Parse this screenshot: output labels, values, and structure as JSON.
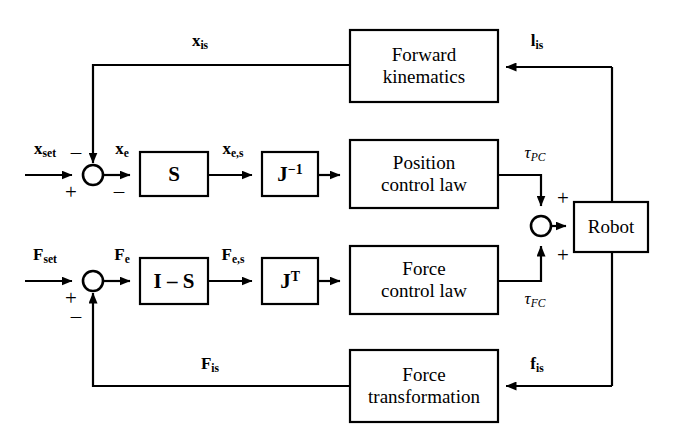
{
  "diagram": {
    "type": "control-block-diagram",
    "stroke_color": "#000000",
    "background_color": "#ffffff",
    "blocks": [
      {
        "id": "forward_kinematics",
        "label": "Forward\nkinematics",
        "x": 350,
        "y": 30,
        "w": 148,
        "h": 72
      },
      {
        "id": "position_control_law",
        "label": "Position\ncontrol law",
        "x": 350,
        "y": 140,
        "w": 148,
        "h": 68
      },
      {
        "id": "force_control_law",
        "label": "Force\ncontrol law",
        "x": 350,
        "y": 246,
        "w": 148,
        "h": 68
      },
      {
        "id": "force_transformation",
        "label": "Force\ntransformation",
        "x": 350,
        "y": 350,
        "w": 148,
        "h": 72
      },
      {
        "id": "robot",
        "label": "Robot",
        "x": 574,
        "y": 202,
        "w": 74,
        "h": 50
      },
      {
        "id": "selection_matrix",
        "label": "S",
        "x": 140,
        "y": 152,
        "w": 68,
        "h": 44
      },
      {
        "id": "jacobian_inverse",
        "label": "J<sup>−1</sup>",
        "x": 262,
        "y": 152,
        "w": 56,
        "h": 44
      },
      {
        "id": "complement_selection_matrix",
        "label": "I – S",
        "x": 140,
        "y": 258,
        "w": 68,
        "h": 46
      },
      {
        "id": "jacobian_transpose",
        "label": "J<sup>T</sup>",
        "x": 262,
        "y": 258,
        "w": 56,
        "h": 46
      }
    ],
    "summing_junctions": [
      {
        "id": "position_error_sum",
        "cx": 93,
        "cy": 175,
        "r": 10
      },
      {
        "id": "force_error_sum",
        "cx": 93,
        "cy": 281,
        "r": 10
      },
      {
        "id": "torque_sum",
        "cx": 541,
        "cy": 226,
        "r": 10
      }
    ],
    "signal_labels": [
      {
        "id": "x_is",
        "text": "x<sub>is</sub>",
        "bold": true,
        "x": 200,
        "y": 40
      },
      {
        "id": "l_is",
        "text": "l<sub>is</sub>",
        "bold": true,
        "x": 537,
        "y": 40
      },
      {
        "id": "x_set",
        "text": "x<sub>set</sub>",
        "bold": true,
        "x": 45,
        "y": 148
      },
      {
        "id": "x_e",
        "text": "x<sub>e</sub>",
        "bold": true,
        "x": 122,
        "y": 148
      },
      {
        "id": "x_es",
        "text": "x<sub>e,s</sub>",
        "bold": true,
        "x": 233,
        "y": 148
      },
      {
        "id": "tau_pc",
        "text": "τ<sub>PC</sub>",
        "italic": true,
        "x": 535,
        "y": 152
      },
      {
        "id": "F_set",
        "text": "F<sub>set</sub>",
        "bold": true,
        "x": 45,
        "y": 254
      },
      {
        "id": "F_e",
        "text": "F<sub>e</sub>",
        "bold": true,
        "x": 122,
        "y": 254
      },
      {
        "id": "F_es",
        "text": "F<sub>e,s</sub>",
        "bold": true,
        "x": 233,
        "y": 254
      },
      {
        "id": "tau_fc",
        "text": "τ<sub>FC</sub>",
        "italic": true,
        "x": 535,
        "y": 298
      },
      {
        "id": "F_is",
        "text": "F<sub>is</sub>",
        "bold": true,
        "x": 210,
        "y": 363
      },
      {
        "id": "f_is",
        "text": "f<sub>is</sub>",
        "bold": true,
        "x": 537,
        "y": 363
      }
    ],
    "sign_markers": [
      {
        "id": "position-sum-plus-in",
        "text": "+",
        "x": 71,
        "y": 192
      },
      {
        "id": "position-sum-minus-fb",
        "text": "–",
        "x": 76,
        "y": 152
      },
      {
        "id": "position-sum-minus-out",
        "text": "–",
        "x": 119,
        "y": 191
      },
      {
        "id": "force-sum-plus-in",
        "text": "+",
        "x": 71,
        "y": 298
      },
      {
        "id": "force-sum-minus-fb",
        "text": "–",
        "x": 76,
        "y": 316
      },
      {
        "id": "torque-sum-plus-top",
        "text": "+",
        "x": 563,
        "y": 198
      },
      {
        "id": "torque-sum-plus-bottom",
        "text": "+",
        "x": 563,
        "y": 255
      }
    ],
    "connections": [
      {
        "id": "x-set-input-to-sum",
        "from": "x_set source",
        "to": "position_error_sum"
      },
      {
        "id": "position-sum-to-selection",
        "from": "position_error_sum",
        "to": "selection_matrix"
      },
      {
        "id": "selection-to-jacobian-inverse",
        "from": "selection_matrix",
        "to": "jacobian_inverse"
      },
      {
        "id": "jacobian-inverse-to-position",
        "from": "jacobian_inverse",
        "to": "position_control_law"
      },
      {
        "id": "position-law-to-torque-sum",
        "from": "position_control_law",
        "to": "torque_sum"
      },
      {
        "id": "F-set-input-to-sum",
        "from": "F_set source",
        "to": "force_error_sum"
      },
      {
        "id": "force-sum-to-complement",
        "from": "force_error_sum",
        "to": "complement_selection_matrix"
      },
      {
        "id": "complement-to-jacobian-transp",
        "from": "complement_selection_matrix",
        "to": "jacobian_transpose"
      },
      {
        "id": "jacobian-transp-to-force-law",
        "from": "jacobian_transpose",
        "to": "force_control_law"
      },
      {
        "id": "force-law-to-torque-sum",
        "from": "force_control_law",
        "to": "torque_sum"
      },
      {
        "id": "torque-sum-to-robot",
        "from": "torque_sum",
        "to": "robot"
      },
      {
        "id": "robot-to-forward-kinematics",
        "from": "robot",
        "to": "forward_kinematics"
      },
      {
        "id": "forward-kin-to-position-sum",
        "from": "forward_kinematics",
        "to": "position_error_sum"
      },
      {
        "id": "robot-to-force-transformation",
        "from": "robot",
        "to": "force_transformation"
      },
      {
        "id": "force-transf-to-force-sum",
        "from": "force_transformation",
        "to": "force_error_sum"
      }
    ]
  }
}
